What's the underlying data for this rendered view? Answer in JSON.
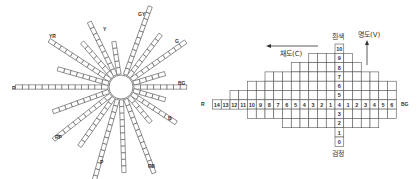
{
  "hue_wheel": {
    "center": [
      121,
      87
    ],
    "hub_radius": 12,
    "rays": [
      {
        "label": "R",
        "angle": 180,
        "cells": 14,
        "label_pos": [
          12,
          90
        ]
      },
      {
        "label": "YR",
        "angle": 213,
        "cells": 11,
        "label_pos": [
          49,
          38
        ]
      },
      {
        "label": "",
        "angle": 196,
        "cells": 8
      },
      {
        "label": "",
        "angle": 229,
        "cells": 7
      },
      {
        "label": "Y",
        "angle": 244,
        "cells": 9,
        "label_pos": [
          103,
          31
        ]
      },
      {
        "label": "",
        "angle": 261,
        "cells": 5
      },
      {
        "label": "GY",
        "angle": 290,
        "cells": 11,
        "label_pos": [
          138,
          16
        ]
      },
      {
        "label": "",
        "angle": 307,
        "cells": 8
      },
      {
        "label": "G",
        "angle": 325,
        "cells": 10,
        "label_pos": [
          175,
          43
        ]
      },
      {
        "label": "",
        "angle": 343,
        "cells": 5
      },
      {
        "label": "BG",
        "angle": 360,
        "cells": 8,
        "label_pos": [
          178,
          85
        ]
      },
      {
        "label": "",
        "angle": 16,
        "cells": 5
      },
      {
        "label": "B",
        "angle": 33,
        "cells": 8,
        "label_pos": [
          168,
          120
        ]
      },
      {
        "label": "",
        "angle": 50,
        "cells": 5
      },
      {
        "label": "PB",
        "angle": 69,
        "cells": 12,
        "label_pos": [
          148,
          168
        ]
      },
      {
        "label": "",
        "angle": 88,
        "cells": 11
      },
      {
        "label": "P",
        "angle": 106,
        "cells": 13,
        "label_pos": [
          100,
          164
        ]
      },
      {
        "label": "",
        "angle": 125,
        "cells": 9
      },
      {
        "label": "RP",
        "angle": 142,
        "cells": 11,
        "label_pos": [
          55,
          139
        ]
      },
      {
        "label": "",
        "angle": 160,
        "cells": 9
      }
    ]
  },
  "munsell_grid": {
    "value_axis_label": "명도(V)",
    "chroma_axis_label": "채도(C)",
    "top_label": "흰색",
    "bottom_label": "검정",
    "left_hue": "R",
    "right_hue": "BG",
    "value_numbers": [
      "10",
      "9",
      "8",
      "7",
      "6",
      "5",
      "4",
      "3",
      "2",
      "1",
      "0"
    ],
    "left_chroma_numbers": [
      "14",
      "13",
      "12",
      "11",
      "10",
      "9",
      "8",
      "7",
      "6",
      "5",
      "4",
      "3",
      "2",
      "1"
    ],
    "right_chroma_numbers": [
      "1",
      "2",
      "3",
      "4",
      "5",
      "6"
    ],
    "rows": [
      {
        "value": 10,
        "left": 0,
        "right": 0
      },
      {
        "value": 9,
        "left": 3,
        "right": 1
      },
      {
        "value": 8,
        "left": 5,
        "right": 2
      },
      {
        "value": 7,
        "left": 8,
        "right": 4
      },
      {
        "value": 6,
        "left": 10,
        "right": 6
      },
      {
        "value": 5,
        "left": 12,
        "right": 6
      },
      {
        "value": 4,
        "left": 14,
        "right": 6
      },
      {
        "value": 3,
        "left": 10,
        "right": 6
      },
      {
        "value": 2,
        "left": 6,
        "right": 4
      },
      {
        "value": 1,
        "left": 0,
        "right": 0
      },
      {
        "value": 0,
        "left": 0,
        "right": 0
      }
    ]
  }
}
